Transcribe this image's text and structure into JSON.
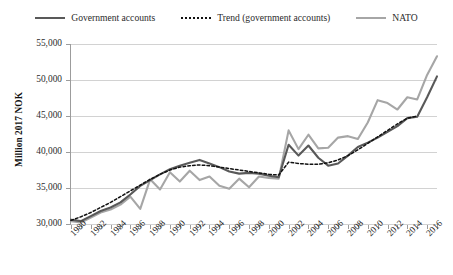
{
  "legend": {
    "items": [
      {
        "label": "Government accounts",
        "style": "solid",
        "color": "#595959",
        "name": "government-accounts"
      },
      {
        "label": "Trend (government accounts)",
        "style": "dotted",
        "color": "#111111",
        "name": "trend"
      },
      {
        "label": "NATO",
        "style": "solid",
        "color": "#a6a6a6",
        "name": "nato"
      }
    ]
  },
  "axes": {
    "y_title": "Million 2017 NOK",
    "y_ticks": [
      "30,000",
      "35,000",
      "40,000",
      "45,000",
      "50,000",
      "55,000"
    ],
    "x_ticks": [
      "1980",
      "1982",
      "1984",
      "1986",
      "1988",
      "1990",
      "1992",
      "1994",
      "1996",
      "1998",
      "2000",
      "2002",
      "2004",
      "2006",
      "2008",
      "2010",
      "2012",
      "2014",
      "2016"
    ]
  },
  "chart_data": {
    "type": "line",
    "title": "",
    "xlabel": "",
    "ylabel": "Million 2017 NOK",
    "ylim": [
      30000,
      55000
    ],
    "ytick_step": 5000,
    "xlim": [
      1980,
      2017
    ],
    "grid": true,
    "legend_position": "top",
    "x": [
      1980,
      1981,
      1982,
      1983,
      1984,
      1985,
      1986,
      1987,
      1988,
      1989,
      1990,
      1991,
      1992,
      1993,
      1994,
      1995,
      1996,
      1997,
      1998,
      1999,
      2000,
      2001,
      2002,
      2003,
      2004,
      2005,
      2006,
      2007,
      2008,
      2009,
      2010,
      2011,
      2012,
      2013,
      2014,
      2015,
      2016,
      2017
    ],
    "series": [
      {
        "name": "Government accounts",
        "color": "#595959",
        "style": "solid",
        "values": [
          30600,
          30400,
          31100,
          31800,
          32300,
          33000,
          34100,
          35300,
          36100,
          36900,
          37600,
          38100,
          38500,
          38900,
          38400,
          37900,
          37300,
          37000,
          37100,
          37000,
          36700,
          36500,
          41000,
          39500,
          40900,
          39200,
          38100,
          38400,
          39500,
          40700,
          41300,
          42000,
          42800,
          43600,
          44700,
          44900,
          47600,
          50500
        ]
      },
      {
        "name": "NATO",
        "color": "#a6a6a6",
        "style": "solid",
        "values": [
          30400,
          30200,
          30900,
          31600,
          32000,
          32700,
          33800,
          32100,
          36200,
          34800,
          37200,
          35900,
          37400,
          36100,
          36600,
          35300,
          34900,
          36300,
          35100,
          36600,
          36400,
          36300,
          43000,
          40400,
          42400,
          40500,
          40600,
          42000,
          42200,
          41800,
          44100,
          47200,
          46800,
          45900,
          47600,
          47300,
          50700,
          53300
        ]
      },
      {
        "name": "Trend (government accounts)",
        "color": "#111111",
        "style": "dotted",
        "values": [
          30500,
          31000,
          31600,
          32300,
          33000,
          33800,
          34600,
          35400,
          36200,
          36900,
          37500,
          37900,
          38100,
          38200,
          38100,
          37900,
          37700,
          37500,
          37300,
          37100,
          36900,
          36800,
          38600,
          38400,
          38300,
          38300,
          38500,
          38900,
          39500,
          40300,
          41200,
          42100,
          43000,
          43900,
          44700,
          45000,
          null,
          null
        ]
      }
    ]
  }
}
